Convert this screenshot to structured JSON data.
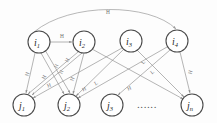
{
  "figure": {
    "background_color": "#fdfdfd",
    "edge_color": "#8d8d8d",
    "node_stroke_color": "#4a4a4a",
    "label_color": "#6f6f6f"
  },
  "top_nodes": [
    {
      "id": "i1",
      "base": "i",
      "sub": "1",
      "cx": 39,
      "cy": 42,
      "r": 11
    },
    {
      "id": "i2",
      "base": "i",
      "sub": "2",
      "cx": 84,
      "cy": 42,
      "r": 11
    },
    {
      "id": "i3",
      "base": "i",
      "sub": "3",
      "cx": 131,
      "cy": 41,
      "r": 11
    },
    {
      "id": "i4",
      "base": "i",
      "sub": "4",
      "cx": 177,
      "cy": 41,
      "r": 11
    }
  ],
  "bottom_nodes": [
    {
      "id": "j1",
      "base": "j",
      "sub": "1",
      "cx": 24,
      "cy": 105,
      "r": 11
    },
    {
      "id": "j2",
      "base": "j",
      "sub": "2",
      "cx": 69,
      "cy": 105,
      "r": 11
    },
    {
      "id": "j3",
      "base": "j",
      "sub": "3",
      "cx": 112,
      "cy": 105,
      "r": 11
    },
    {
      "id": "jn",
      "base": "j",
      "sub": "n",
      "cx": 192,
      "cy": 105,
      "r": 11
    }
  ],
  "ellipsis": {
    "text": "......",
    "cx": 147,
    "cy": 104
  },
  "horizontal_edges": [
    {
      "from": "i1",
      "to": "i2",
      "label": "H",
      "label_x": 62,
      "label_y": 36
    }
  ],
  "arc_edges": [
    {
      "from": "i1",
      "to": "i4",
      "label": "H",
      "label_x": 108,
      "label_y": 12
    }
  ],
  "cross_edges": [
    {
      "from": "i1",
      "to": "j1",
      "label": "H",
      "label_x": 27,
      "label_y": 74,
      "rotate": -72
    },
    {
      "from": "i1",
      "to": "j2",
      "label": "H",
      "label_x": 44,
      "label_y": 77,
      "rotate": -62
    },
    {
      "from": "i1",
      "to": "j2",
      "label": "H",
      "label_x": 49,
      "label_y": 85,
      "rotate": -20
    },
    {
      "from": "i2",
      "to": "j1",
      "label": "H",
      "label_x": 56,
      "label_y": 66,
      "rotate": -66
    },
    {
      "from": "i2",
      "to": "j1",
      "label": "H",
      "label_x": 61,
      "label_y": 72,
      "rotate": -66
    },
    {
      "from": "i2",
      "to": "j2",
      "label": "H",
      "label_x": 72,
      "label_y": 79,
      "rotate": -70
    },
    {
      "from": "i2",
      "to": "jn",
      "label": "L",
      "label_x": 96,
      "label_y": 83,
      "rotate": -30
    },
    {
      "from": "i3",
      "to": "j1",
      "label": "H",
      "label_x": 84,
      "label_y": 89,
      "rotate": -24
    },
    {
      "from": "i3",
      "to": "j2",
      "label": "H",
      "label_x": 67,
      "label_y": 60,
      "rotate": -60
    },
    {
      "from": "i3",
      "to": "jn",
      "label": "L",
      "label_x": 152,
      "label_y": 72,
      "rotate": -40
    },
    {
      "from": "i4",
      "to": "j2",
      "label": "H",
      "label_x": 129,
      "label_y": 88,
      "rotate": -22
    },
    {
      "from": "i4",
      "to": "j3",
      "label": "L",
      "label_x": 143,
      "label_y": 62,
      "rotate": -58
    },
    {
      "from": "i4",
      "to": "jn",
      "label": "H",
      "label_x": 190,
      "label_y": 72,
      "rotate": -76
    }
  ]
}
